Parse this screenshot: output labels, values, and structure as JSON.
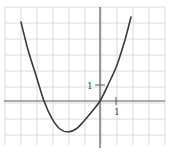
{
  "chart_data": {
    "type": "line",
    "title": "",
    "xlabel": "",
    "ylabel": "",
    "grid": true,
    "unit_px": 16,
    "origin_px": [
      100,
      101
    ],
    "xlim": [
      -6,
      4
    ],
    "ylim": [
      -3,
      6
    ],
    "x_tick_labels": [
      {
        "value": 1,
        "label": "1"
      }
    ],
    "y_tick_labels": [
      {
        "value": 1,
        "label": "1"
      }
    ],
    "series": [
      {
        "name": "parabola",
        "description": "upward-opening parabola through origin, vertex near (-2, -2), other x-intercept near -3.5",
        "points": [
          [
            -4.94,
            4.94
          ],
          [
            -4.5,
            3.2
          ],
          [
            -4.0,
            1.6
          ],
          [
            -3.5,
            0.0
          ],
          [
            -3.0,
            -1.1
          ],
          [
            -2.5,
            -1.75
          ],
          [
            -2.0,
            -1.94
          ],
          [
            -1.5,
            -1.75
          ],
          [
            -1.0,
            -1.25
          ],
          [
            -0.5,
            -0.65
          ],
          [
            0.0,
            0.0
          ],
          [
            0.5,
            1.0
          ],
          [
            1.06,
            2.25
          ],
          [
            1.56,
            3.81
          ],
          [
            1.94,
            5.25
          ]
        ]
      }
    ],
    "colors": {
      "grid": "#dcdcdc",
      "axis": "#5a5a5a",
      "curve": "#3a3a3a"
    }
  },
  "labels": {
    "x_tick": "1",
    "y_tick": "1"
  }
}
